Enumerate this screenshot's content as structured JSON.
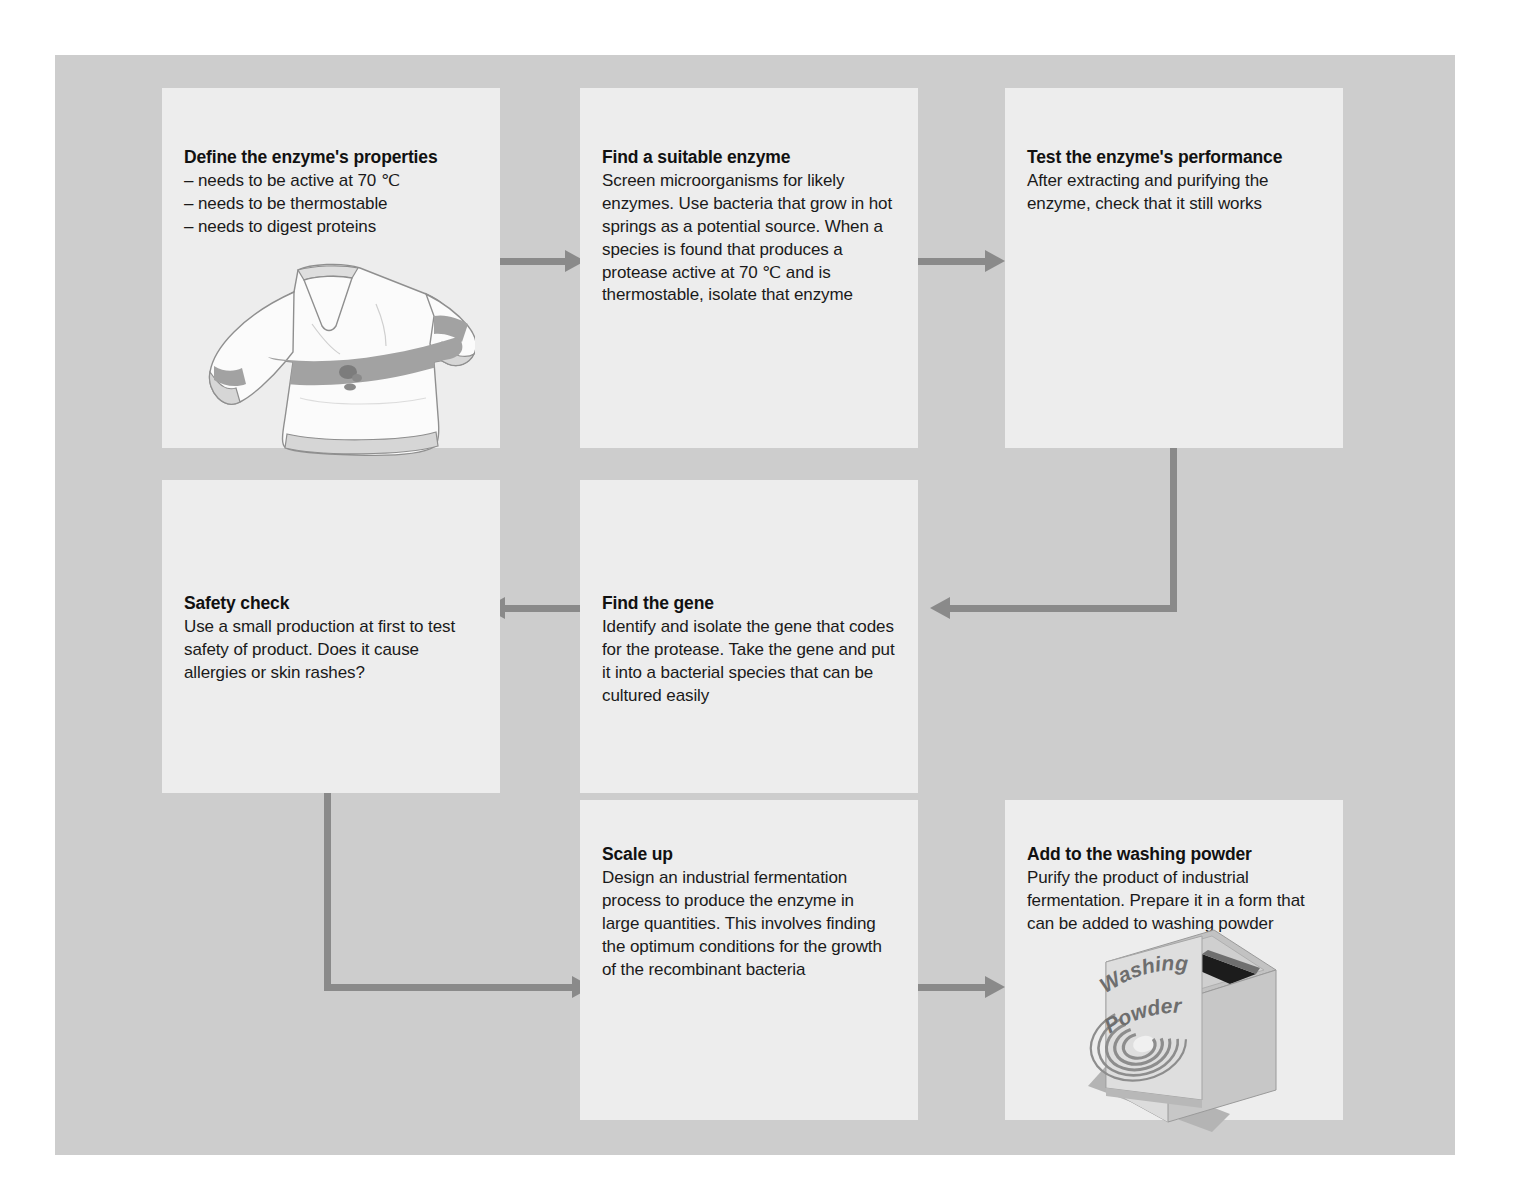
{
  "diagram": {
    "panel_background": "#cdcdcd",
    "box_background": "#ededed",
    "arrow_color": "#8a8a8a",
    "boxes": [
      {
        "id": "define-properties",
        "heading": "Define the enzyme's properties",
        "bullets": [
          "– needs to be active at 70 ℃",
          "– needs to be thermostable",
          "– needs to digest proteins"
        ],
        "body": "",
        "illustration": "sweater"
      },
      {
        "id": "find-enzyme",
        "heading": "Find a suitable enzyme",
        "body": "Screen microorganisms for likely\nenzymes. Use bacteria that grow in hot\nsprings as a potential source. When a\nspecies is found that produces a\nprotease active at 70 ℃ and is\nthermostable, isolate that enzyme",
        "illustration": ""
      },
      {
        "id": "test-performance",
        "heading": "Test the enzyme's performance",
        "body": "After extracting and purifying the\nenzyme, check that it still works",
        "illustration": ""
      },
      {
        "id": "safety-check",
        "heading": "Safety check",
        "body": "Use a small production at first to test\nsafety of product. Does it cause\nallergies or skin rashes?",
        "illustration": ""
      },
      {
        "id": "find-gene",
        "heading": "Find the gene",
        "body": "Identify and isolate the gene that codes\nfor the protease. Take the gene and put\nit into a bacterial species that can be\ncultured easily",
        "illustration": ""
      },
      {
        "id": "scale-up",
        "heading": "Scale up",
        "body": "Design an industrial fermentation\nprocess to produce the enzyme in\nlarge quantities. This involves finding\nthe optimum conditions for the growth\nof the recombinant bacteria",
        "illustration": ""
      },
      {
        "id": "add-washing-powder",
        "heading": "Add to the washing powder",
        "body": "Purify the product of industrial\nfermentation. Prepare it in a form that\ncan be added to washing powder",
        "illustration": "washing-powder-box"
      }
    ],
    "illustrations": {
      "washing_powder": {
        "label_line1": "Washing",
        "label_line2": "Powder"
      }
    }
  }
}
